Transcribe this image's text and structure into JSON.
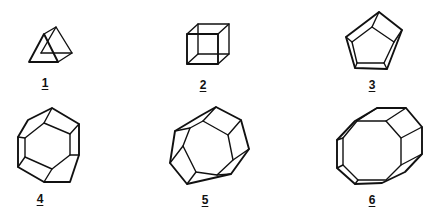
{
  "diagram": {
    "stroke_color": "#111111",
    "background": "#ffffff",
    "figures": [
      {
        "id": 1,
        "label": "1",
        "shape": "triangular-prism"
      },
      {
        "id": 2,
        "label": "2",
        "shape": "cube"
      },
      {
        "id": 3,
        "label": "3",
        "shape": "pentagonal-prism"
      },
      {
        "id": 4,
        "label": "4",
        "shape": "hexagonal-prism"
      },
      {
        "id": 5,
        "label": "5",
        "shape": "heptagonal-prism"
      },
      {
        "id": 6,
        "label": "6",
        "shape": "octagonal-prism"
      }
    ]
  }
}
